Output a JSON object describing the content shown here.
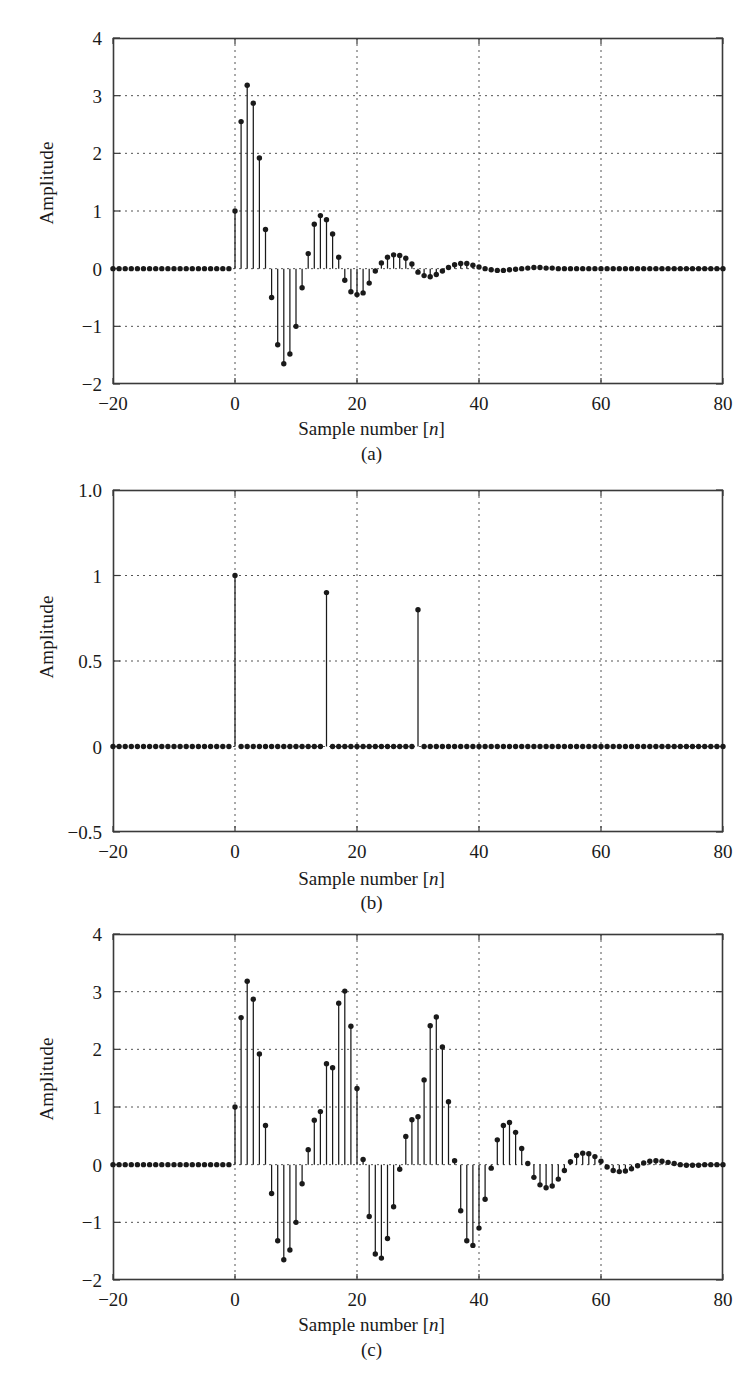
{
  "figure": {
    "axis_label_y": "Amplitude",
    "axis_label_x_prefix": "Sample number [",
    "axis_label_x_var": "n",
    "axis_label_x_suffix": "]",
    "caption_a": "(a)",
    "caption_b": "(b)",
    "caption_c": "(c)",
    "line_color": "#1a1a1a",
    "grid_color": "#555555",
    "frame_color": "#3a3a3a",
    "background": "#ffffff"
  },
  "chart_data": [
    {
      "id": "a",
      "type": "stem",
      "title": "(a)",
      "xlabel": "Sample number [n]",
      "ylabel": "Amplitude",
      "xlim": [
        -20,
        80
      ],
      "ylim": [
        -2,
        4
      ],
      "xticks": [
        -20,
        0,
        20,
        40,
        60,
        80
      ],
      "xticklabels": [
        "-20",
        "0",
        "20",
        "40",
        "60",
        "80"
      ],
      "yticks": [
        -2,
        -1,
        0,
        1,
        2,
        3,
        4
      ],
      "yticklabels": [
        "-2",
        "-1",
        "0",
        "1",
        "2",
        "3",
        "4"
      ],
      "grid": true,
      "legend": "none",
      "x": [
        -20,
        -19,
        -18,
        -17,
        -16,
        -15,
        -14,
        -13,
        -12,
        -11,
        -10,
        -9,
        -8,
        -7,
        -6,
        -5,
        -4,
        -3,
        -2,
        -1,
        0,
        1,
        2,
        3,
        4,
        5,
        6,
        7,
        8,
        9,
        10,
        11,
        12,
        13,
        14,
        15,
        16,
        17,
        18,
        19,
        20,
        21,
        22,
        23,
        24,
        25,
        26,
        27,
        28,
        29,
        30,
        31,
        32,
        33,
        34,
        35,
        36,
        37,
        38,
        39,
        40,
        41,
        42,
        43,
        44,
        45,
        46,
        47,
        48,
        49,
        50,
        51,
        52,
        53,
        54,
        55,
        56,
        57,
        58,
        59,
        60,
        61,
        62,
        63,
        64,
        65,
        66,
        67,
        68,
        69,
        70,
        71,
        72,
        73,
        74,
        75,
        76,
        77,
        78,
        79,
        80
      ],
      "values": [
        0,
        0,
        0,
        0,
        0,
        0,
        0,
        0,
        0,
        0,
        0,
        0,
        0,
        0,
        0,
        0,
        0,
        0,
        0,
        0,
        1.0,
        2.55,
        3.18,
        2.87,
        1.92,
        0.68,
        -0.5,
        -1.32,
        -1.65,
        -1.48,
        -1.0,
        -0.33,
        0.26,
        0.77,
        0.92,
        0.85,
        0.6,
        0.2,
        -0.2,
        -0.4,
        -0.45,
        -0.42,
        -0.25,
        -0.04,
        0.1,
        0.2,
        0.24,
        0.23,
        0.18,
        0.08,
        -0.06,
        -0.12,
        -0.14,
        -0.1,
        -0.04,
        0.02,
        0.07,
        0.09,
        0.09,
        0.06,
        0.03,
        0.0,
        -0.02,
        -0.03,
        -0.03,
        -0.02,
        -0.01,
        0.0,
        0.01,
        0.02,
        0.02,
        0.01,
        0.01,
        0.0,
        0.0,
        0.0,
        0.0,
        0.0,
        0.0,
        0.0,
        0.0,
        0.0,
        0.0,
        0.0,
        0.0,
        0.0,
        0.0,
        0.0,
        0.0,
        0.0,
        0.0,
        0.0,
        0.0,
        0.0,
        0.0,
        0.0,
        0.0,
        0.0,
        0.0,
        0.0,
        0.0
      ]
    },
    {
      "id": "b",
      "type": "stem",
      "title": "(b)",
      "xlabel": "Sample number [n]",
      "ylabel": "Amplitude",
      "xlim": [
        -20,
        80
      ],
      "ylim": [
        -0.5,
        1.5
      ],
      "xticks": [
        -20,
        0,
        20,
        40,
        60,
        80
      ],
      "xticklabels": [
        "-20",
        "0",
        "20",
        "40",
        "60",
        "80"
      ],
      "yticks": [
        -0.5,
        0,
        0.5,
        1,
        1.5
      ],
      "yticklabels": [
        "-0.5",
        "0",
        "0.5",
        "1",
        "1.0"
      ],
      "grid": true,
      "legend": "none",
      "impulses": [
        {
          "n": 0,
          "amplitude": 1.0
        },
        {
          "n": 15,
          "amplitude": 0.9
        },
        {
          "n": 30,
          "amplitude": 0.8
        }
      ],
      "x": [
        -20,
        -19,
        -18,
        -17,
        -16,
        -15,
        -14,
        -13,
        -12,
        -11,
        -10,
        -9,
        -8,
        -7,
        -6,
        -5,
        -4,
        -3,
        -2,
        -1,
        0,
        1,
        2,
        3,
        4,
        5,
        6,
        7,
        8,
        9,
        10,
        11,
        12,
        13,
        14,
        15,
        16,
        17,
        18,
        19,
        20,
        21,
        22,
        23,
        24,
        25,
        26,
        27,
        28,
        29,
        30,
        31,
        32,
        33,
        34,
        35,
        36,
        37,
        38,
        39,
        40,
        41,
        42,
        43,
        44,
        45,
        46,
        47,
        48,
        49,
        50,
        51,
        52,
        53,
        54,
        55,
        56,
        57,
        58,
        59,
        60,
        61,
        62,
        63,
        64,
        65,
        66,
        67,
        68,
        69,
        70,
        71,
        72,
        73,
        74,
        75,
        76,
        77,
        78,
        79,
        80
      ],
      "values": [
        0,
        0,
        0,
        0,
        0,
        0,
        0,
        0,
        0,
        0,
        0,
        0,
        0,
        0,
        0,
        0,
        0,
        0,
        0,
        0,
        1.0,
        0,
        0,
        0,
        0,
        0,
        0,
        0,
        0,
        0,
        0,
        0,
        0,
        0,
        0,
        0.9,
        0,
        0,
        0,
        0,
        0,
        0,
        0,
        0,
        0,
        0,
        0,
        0,
        0,
        0,
        0.8,
        0,
        0,
        0,
        0,
        0,
        0,
        0,
        0,
        0,
        0,
        0,
        0,
        0,
        0,
        0,
        0,
        0,
        0,
        0,
        0,
        0,
        0,
        0,
        0,
        0,
        0,
        0,
        0,
        0,
        0,
        0,
        0,
        0,
        0,
        0,
        0,
        0,
        0,
        0,
        0,
        0,
        0,
        0,
        0,
        0,
        0,
        0,
        0,
        0,
        0
      ]
    },
    {
      "id": "c",
      "type": "stem",
      "title": "(c)",
      "xlabel": "Sample number [n]",
      "ylabel": "Amplitude",
      "xlim": [
        -20,
        80
      ],
      "ylim": [
        -2,
        4
      ],
      "xticks": [
        -20,
        0,
        20,
        40,
        60,
        80
      ],
      "xticklabels": [
        "-20",
        "0",
        "20",
        "40",
        "60",
        "80"
      ],
      "yticks": [
        -2,
        -1,
        0,
        1,
        2,
        3,
        4
      ],
      "yticklabels": [
        "-2",
        "-1",
        "0",
        "1",
        "2",
        "3",
        "4"
      ],
      "grid": true,
      "legend": "none",
      "description": "convolution of (a) with (b): copies at n=0 (x1.0), n=15 (x0.9), n=30 (x0.8)",
      "x": [
        -20,
        -19,
        -18,
        -17,
        -16,
        -15,
        -14,
        -13,
        -12,
        -11,
        -10,
        -9,
        -8,
        -7,
        -6,
        -5,
        -4,
        -3,
        -2,
        -1,
        0,
        1,
        2,
        3,
        4,
        5,
        6,
        7,
        8,
        9,
        10,
        11,
        12,
        13,
        14,
        15,
        16,
        17,
        18,
        19,
        20,
        21,
        22,
        23,
        24,
        25,
        26,
        27,
        28,
        29,
        30,
        31,
        32,
        33,
        34,
        35,
        36,
        37,
        38,
        39,
        40,
        41,
        42,
        43,
        44,
        45,
        46,
        47,
        48,
        49,
        50,
        51,
        52,
        53,
        54,
        55,
        56,
        57,
        58,
        59,
        60,
        61,
        62,
        63,
        64,
        65,
        66,
        67,
        68,
        69,
        70,
        71,
        72,
        73,
        74,
        75,
        76,
        77,
        78,
        79,
        80
      ],
      "values": [
        0,
        0,
        0,
        0,
        0,
        0,
        0,
        0,
        0,
        0,
        0,
        0,
        0,
        0,
        0,
        0,
        0,
        0,
        0,
        0,
        1.0,
        2.55,
        3.18,
        2.87,
        1.92,
        0.68,
        -0.5,
        -1.32,
        -1.65,
        -1.48,
        -1.0,
        -0.33,
        0.26,
        0.77,
        0.92,
        1.75,
        1.68,
        2.8,
        3.01,
        2.4,
        1.32,
        0.09,
        -0.9,
        -1.55,
        -1.62,
        -1.28,
        -0.73,
        -0.08,
        0.49,
        0.78,
        0.83,
        1.47,
        2.41,
        2.56,
        2.04,
        1.09,
        0.07,
        -0.8,
        -1.32,
        -1.4,
        -1.1,
        -0.6,
        -0.06,
        0.43,
        0.68,
        0.73,
        0.56,
        0.28,
        0.02,
        -0.22,
        -0.35,
        -0.4,
        -0.37,
        -0.25,
        -0.1,
        0.05,
        0.16,
        0.2,
        0.19,
        0.14,
        0.06,
        -0.04,
        -0.1,
        -0.12,
        -0.11,
        -0.07,
        -0.02,
        0.03,
        0.06,
        0.07,
        0.06,
        0.04,
        0.02,
        0.0,
        -0.01,
        -0.01,
        -0.01,
        0.0,
        0.0,
        0.0,
        0.0
      ]
    }
  ]
}
